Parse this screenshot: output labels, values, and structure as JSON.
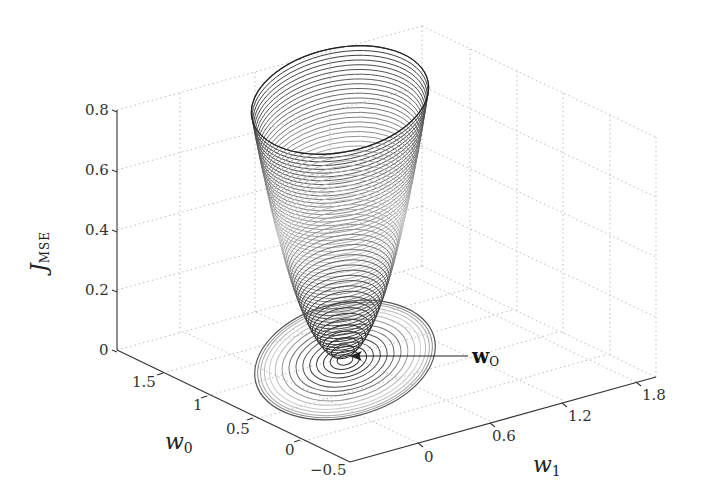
{
  "chart_data": {
    "type": "surface3d",
    "title": "",
    "xlabel": "w_1",
    "ylabel": "w_0",
    "zlabel": "J_MSE",
    "zlabel_main": "J",
    "zlabel_sub": "MSE",
    "xlabel_main": "w",
    "xlabel_sub": "1",
    "ylabel_main": "w",
    "ylabel_sub": "0",
    "x_ticks": [
      "0",
      "0.6",
      "1.2",
      "1.8"
    ],
    "y_ticks": [
      "1.5",
      "1",
      "0.5",
      "0",
      "−0.5"
    ],
    "z_ticks": [
      "0",
      "0.2",
      "0.4",
      "0.6",
      "0.8"
    ],
    "xlim": [
      -0.3,
      2.0
    ],
    "ylim": [
      -0.5,
      1.8
    ],
    "zlim": [
      0,
      0.8
    ],
    "grid": true,
    "grid_style": "dotted",
    "surface": {
      "shape": "paraboloid",
      "min_z": 0.0,
      "max_z": 0.8,
      "rendering": "contour rings"
    },
    "floor_contours": true,
    "annotation": {
      "text_main": "w",
      "text_sub": "O",
      "target": "minimum of surface"
    }
  },
  "colors": {
    "grid": "#bdbdbd",
    "axis": "#333333",
    "surface_dark": "#111111",
    "surface_light": "#dddddd"
  }
}
